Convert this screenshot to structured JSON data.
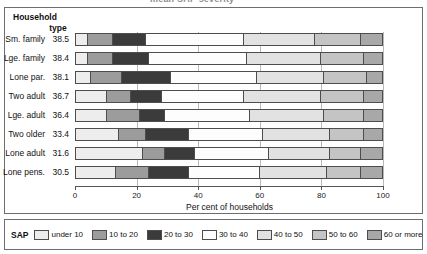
{
  "title_cut": "mean SAP severity",
  "axis_header": {
    "line1": "Household",
    "line2": "type"
  },
  "xaxis": {
    "label": "Per cent of households",
    "ticks": [
      0,
      20,
      40,
      60,
      80,
      100
    ],
    "min": 0,
    "max": 100
  },
  "legend": {
    "title": "SAP",
    "items": [
      {
        "label": "under 10",
        "color": "#ededed"
      },
      {
        "label": "10 to 20",
        "color": "#9c9c9c"
      },
      {
        "label": "20 to 30",
        "color": "#3b3b3b"
      },
      {
        "label": "30 to 40",
        "color": "#fdfdfd"
      },
      {
        "label": "40 to 50",
        "color": "#e2e2e2"
      },
      {
        "label": "50 to 60",
        "color": "#c4c4c4"
      },
      {
        "label": "60 or more",
        "color": "#a8a8a8"
      }
    ]
  },
  "chart_data": {
    "type": "bar",
    "orientation": "horizontal",
    "stacked": true,
    "title": "mean SAP severity",
    "xlabel": "Per cent of households",
    "ylabel": "Household type",
    "xlim": [
      0,
      100
    ],
    "grid": true,
    "legend_position": "bottom",
    "categories": [
      "Sm. family",
      "Lge. family",
      "Lone par.",
      "Two adult",
      "Lge. adult",
      "Two older",
      "Lone adult",
      "Lone pens."
    ],
    "mean_sap": [
      38.5,
      38.4,
      38.1,
      36.7,
      36.4,
      33.4,
      31.6,
      30.5
    ],
    "series": [
      {
        "name": "under 10",
        "values": [
          4,
          4,
          5,
          10,
          10,
          14,
          22,
          13
        ]
      },
      {
        "name": "10 to 20",
        "values": [
          8,
          8,
          10,
          8,
          11,
          9,
          7,
          11
        ]
      },
      {
        "name": "20 to 30",
        "values": [
          11,
          12,
          16,
          10,
          8,
          14,
          10,
          13
        ]
      },
      {
        "name": "30 to 40",
        "values": [
          32,
          32,
          28,
          27,
          28,
          24,
          24,
          23
        ]
      },
      {
        "name": "40 to 50",
        "values": [
          23,
          24,
          22,
          25,
          24,
          22,
          20,
          22
        ]
      },
      {
        "name": "50 to 60",
        "values": [
          15,
          14,
          14,
          14,
          13,
          11,
          10,
          11
        ]
      },
      {
        "name": "60 or more",
        "values": [
          7,
          6,
          5,
          6,
          6,
          6,
          7,
          7
        ]
      }
    ]
  }
}
